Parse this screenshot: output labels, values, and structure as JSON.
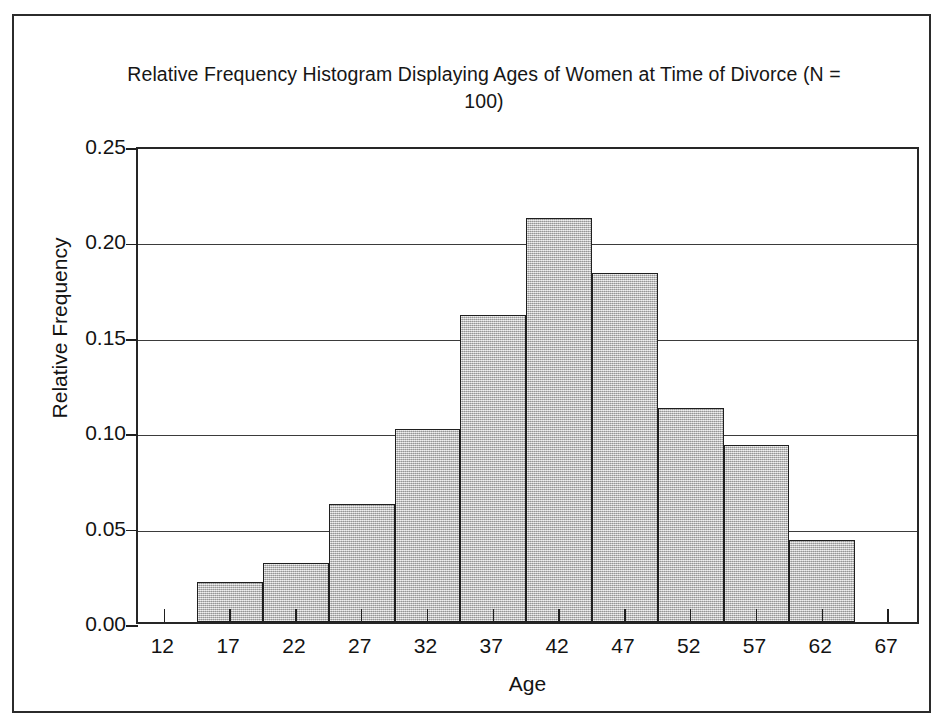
{
  "chart_data": {
    "type": "bar",
    "title": "Relative Frequency Histogram Displaying Ages of Women at Time of Divorce (N = 100)",
    "xlabel": "Age",
    "ylabel": "Relative Frequency",
    "xlim": [
      10,
      69.5
    ],
    "ylim": [
      0.0,
      0.25
    ],
    "grid": true,
    "legend": false,
    "bin_width": 5,
    "bin_edges": [
      14.5,
      19.5,
      24.5,
      29.5,
      34.5,
      39.5,
      44.5,
      49.5,
      54.5,
      59.5,
      64.5
    ],
    "categories": [
      "14.5-19.5",
      "19.5-24.5",
      "24.5-29.5",
      "29.5-34.5",
      "34.5-39.5",
      "39.5-44.5",
      "44.5-49.5",
      "49.5-54.5",
      "54.5-59.5",
      "59.5-64.5"
    ],
    "values": [
      0.021,
      0.031,
      0.062,
      0.101,
      0.161,
      0.212,
      0.183,
      0.112,
      0.093,
      0.043
    ],
    "xticks": [
      12,
      17,
      22,
      27,
      32,
      37,
      42,
      47,
      52,
      57,
      62,
      67
    ],
    "xticklabels": [
      "12",
      "17",
      "22",
      "27",
      "32",
      "37",
      "42",
      "47",
      "52",
      "57",
      "62",
      "67"
    ],
    "yticks": [
      0.0,
      0.05,
      0.1,
      0.15,
      0.2,
      0.25
    ],
    "yticklabels": [
      "0.00",
      "0.05",
      "0.10",
      "0.15",
      "0.20",
      "0.25"
    ],
    "colors": {
      "bar_fill": "#b8b8b8",
      "bar_edge": "#1f1f1f",
      "grid": "#3b3b3b",
      "axis": "#262626",
      "text": "#131313",
      "background": "#ffffff"
    }
  }
}
